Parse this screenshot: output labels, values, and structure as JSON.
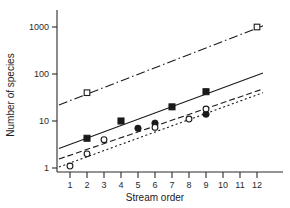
{
  "chart_data": {
    "type": "scatter",
    "title": "",
    "xlabel": "Stream order",
    "ylabel": "Number of species",
    "xlim": [
      0.2,
      12.9
    ],
    "ylim": [
      0.85,
      1700
    ],
    "yscale": "log",
    "xscale": "linear",
    "grid": false,
    "legend": "none",
    "xticks": [
      1,
      2,
      3,
      4,
      5,
      6,
      7,
      8,
      9,
      10,
      11,
      12
    ],
    "xtick_labels": [
      "1",
      "2",
      "3",
      "4",
      "5",
      "6",
      "7",
      "8",
      "9",
      "10",
      "11",
      "12"
    ],
    "yticks": [
      1,
      10,
      100,
      1000
    ],
    "ytick_labels": [
      "1",
      "10",
      "100",
      "1000"
    ],
    "series": [
      {
        "name": "open-squares-dashdot",
        "marker": "open-square",
        "linestyle": "dashdot",
        "color": "#1a1a1a",
        "points": [
          {
            "x": 2,
            "y": 40
          },
          {
            "x": 12,
            "y": 1000
          }
        ],
        "fit_line": {
          "x0": 0.35,
          "y0": 22,
          "x1": 12.35,
          "y1": 1060
        }
      },
      {
        "name": "filled-squares-solid",
        "marker": "filled-square",
        "linestyle": "solid",
        "color": "#1a1a1a",
        "points": [
          {
            "x": 2,
            "y": 4.3
          },
          {
            "x": 4,
            "y": 10
          },
          {
            "x": 7,
            "y": 20
          },
          {
            "x": 9,
            "y": 42
          }
        ],
        "fit_line": {
          "x0": 0.35,
          "y0": 2.6,
          "x1": 12.35,
          "y1": 105
        }
      },
      {
        "name": "filled-circles-dashed",
        "marker": "filled-circle",
        "linestyle": "dashed",
        "color": "#1a1a1a",
        "points": [
          {
            "x": 5,
            "y": 7.0
          },
          {
            "x": 6,
            "y": 9.0
          },
          {
            "x": 9,
            "y": 14.0
          }
        ],
        "fit_line": {
          "x0": 0.35,
          "y0": 1.55,
          "x1": 12.35,
          "y1": 48
        }
      },
      {
        "name": "open-circles-dotted",
        "marker": "open-circle",
        "linestyle": "dotted",
        "color": "#1a1a1a",
        "points": [
          {
            "x": 1,
            "y": 1.1
          },
          {
            "x": 2,
            "y": 2.0
          },
          {
            "x": 3,
            "y": 4.0
          },
          {
            "x": 6,
            "y": 7.3
          },
          {
            "x": 8,
            "y": 11.0
          },
          {
            "x": 9,
            "y": 18.0
          }
        ],
        "fit_line": {
          "x0": 0.35,
          "y0": 1.05,
          "x1": 12.35,
          "y1": 40
        }
      }
    ]
  },
  "axes": {
    "x_title": "Stream order",
    "y_title": "Number of species"
  }
}
